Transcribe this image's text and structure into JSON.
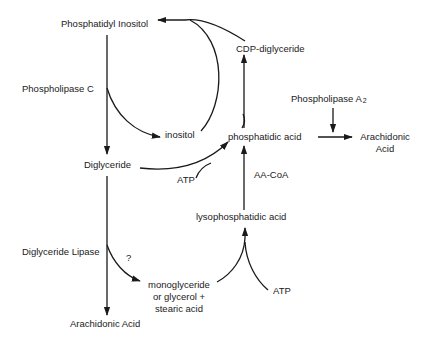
{
  "diagram": {
    "type": "biochemical-pathway",
    "nodes": {
      "phosphatidyl_inositol": "Phosphatidyl Inositol",
      "inositol": "inositol",
      "cdp_diglyceride": "CDP-diglyceride",
      "phosphatidic_acid": "phosphatidic acid",
      "arachidonic_acid_right_line1": "Arachidonic",
      "arachidonic_acid_right_line2": "Acid",
      "diglyceride": "Diglyceride",
      "lysophosphatidic_acid": "lysophosphatidic acid",
      "monoglyceride_line1": "monoglyceride",
      "monoglyceride_line2": "or glycerol +",
      "monoglyceride_line3": "stearic acid",
      "arachidonic_acid_bottom": "Arachidonic Acid"
    },
    "enzymes": {
      "phospholipase_c": "Phospholipase C",
      "phospholipase_a2": "Phospholipase A",
      "phospholipase_a2_subscript": "2",
      "diglyceride_lipase": "Diglyceride Lipase"
    },
    "cofactors": {
      "atp_upper": "ATP",
      "atp_lower": "ATP",
      "aa_coa": "AA-CoA"
    },
    "annotations": {
      "uncertain_step": "?"
    },
    "edges": [
      {
        "from": "Phosphatidyl Inositol",
        "to": "Diglyceride",
        "via": "Phospholipase C"
      },
      {
        "from": "Phosphatidyl Inositol",
        "to": "inositol",
        "via": "Phospholipase C"
      },
      {
        "from": "inositol",
        "to": "Phosphatidyl Inositol"
      },
      {
        "from": "CDP-diglyceride",
        "to": "Phosphatidyl Inositol"
      },
      {
        "from": "phosphatidic acid",
        "to": "CDP-diglyceride"
      },
      {
        "from": "Diglyceride",
        "to": "phosphatidic acid",
        "cofactor": "ATP"
      },
      {
        "from": "phosphatidic acid",
        "to": "Arachidonic Acid",
        "via": "Phospholipase A2"
      },
      {
        "from": "lysophosphatidic acid",
        "to": "phosphatidic acid",
        "cofactor": "AA-CoA"
      },
      {
        "from": "Diglyceride",
        "to": "Arachidonic Acid",
        "via": "Diglyceride Lipase"
      },
      {
        "from": "Diglyceride",
        "to": "monoglyceride or glycerol + stearic acid",
        "note": "?"
      },
      {
        "from": "monoglyceride or glycerol + stearic acid",
        "to": "lysophosphatidic acid",
        "cofactor": "ATP"
      }
    ]
  },
  "colors": {
    "ink": "#1a1a1a",
    "background": "#ffffff"
  }
}
